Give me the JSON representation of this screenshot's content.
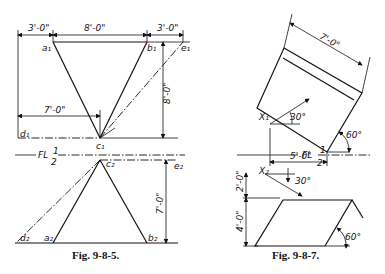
{
  "figures": [
    {
      "caption": "Fig. 9-8-5.",
      "top_view": {
        "points": {
          "a1": "a₁",
          "b1": "b₁",
          "e1": "e₁",
          "c1": "c₁",
          "d1": "d₁"
        },
        "dimensions": {
          "left": "3'-0\"",
          "middle": "8'-0\"",
          "right": "3'-0\"",
          "lower": "7'-0\"",
          "height": "8'-0\""
        }
      },
      "folding_line": {
        "label": "FL",
        "top": "1",
        "bottom": "2"
      },
      "front_view": {
        "points": {
          "c2": "c₂",
          "e2": "e₂",
          "d2": "d₂",
          "a2": "a₂",
          "b2": "b₂"
        },
        "dimensions": {
          "height": "7'-0\""
        }
      }
    },
    {
      "caption": "Fig. 9-8-7.",
      "top_view": {
        "points": {
          "x1": "X₁"
        },
        "dimensions": {
          "width": "7'-0\"",
          "base": "5'-0\""
        },
        "angles": {
          "arrow": "30°",
          "side": "60°"
        }
      },
      "folding_line": {
        "label": "FL",
        "top": "1",
        "bottom": "2"
      },
      "front_view": {
        "points": {
          "x2": "X₂"
        },
        "dimensions": {
          "upper": "2'-0\"",
          "lower": "4'-0\""
        },
        "angles": {
          "arrow": "30°",
          "side": "60°"
        }
      }
    }
  ]
}
